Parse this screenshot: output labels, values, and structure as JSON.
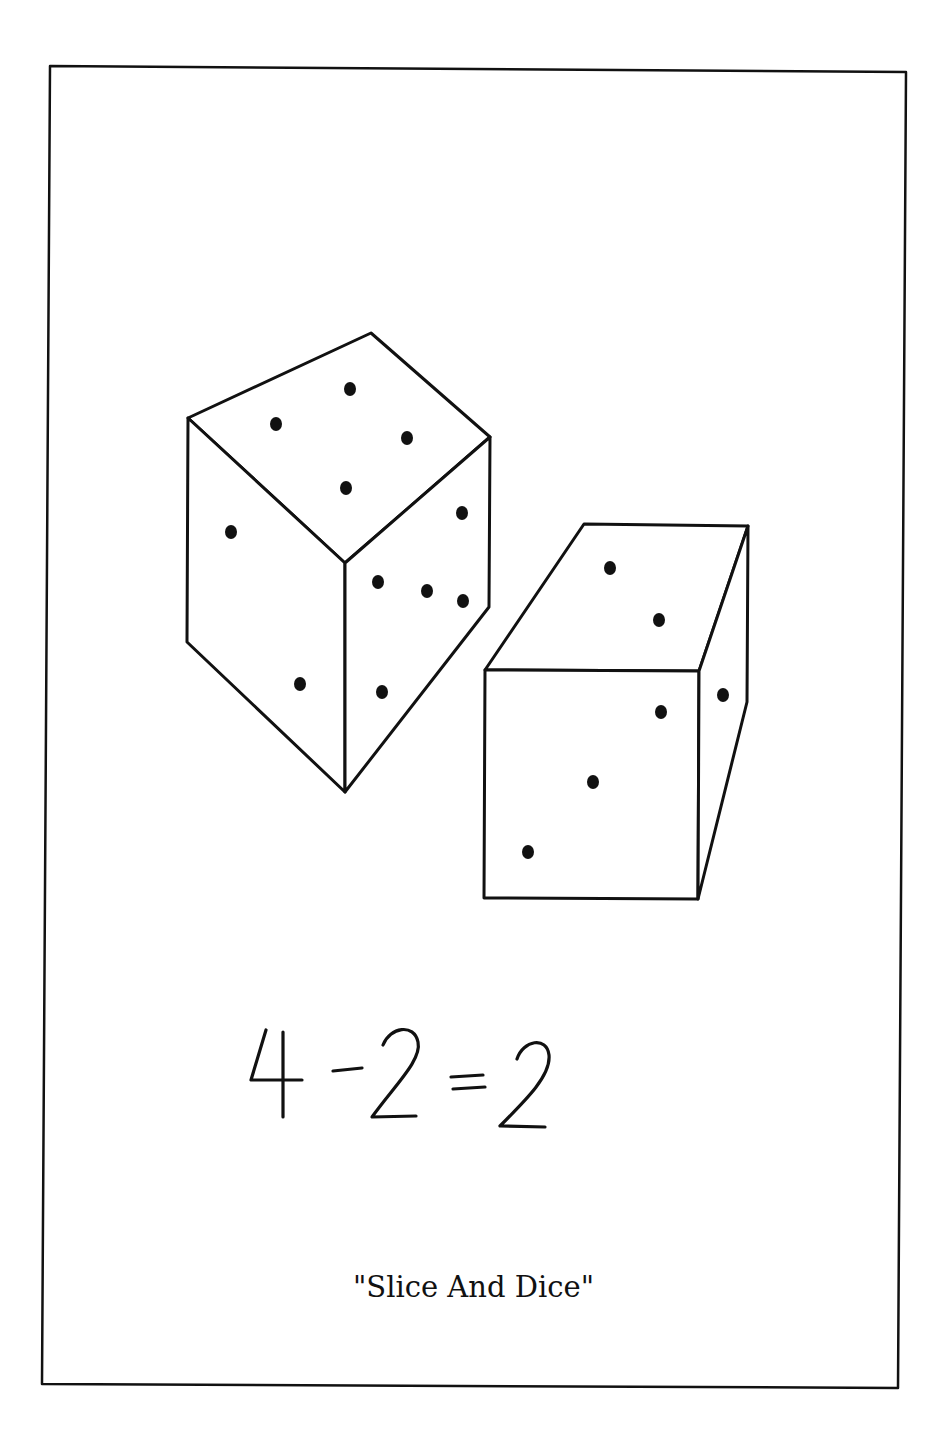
{
  "page": {
    "background": "#ffffff",
    "ink_color": "#111111",
    "frame": {
      "points": [
        [
          50,
          66
        ],
        [
          906,
          72
        ],
        [
          898,
          1388
        ],
        [
          42,
          1384
        ]
      ]
    }
  },
  "illustration": {
    "subject": "two dice, one sliced",
    "die_left": {
      "name": "tall-die",
      "faces": {
        "top": {
          "points": [
            [
              188,
              418
            ],
            [
              371,
              333
            ],
            [
              490,
              437
            ],
            [
              345,
              563
            ]
          ],
          "pips": 4,
          "pip_positions": [
            [
              276,
              424
            ],
            [
              350,
              389
            ],
            [
              407,
              438
            ],
            [
              346,
              488
            ]
          ]
        },
        "left": {
          "points": [
            [
              188,
              418
            ],
            [
              345,
              563
            ],
            [
              345,
              792
            ],
            [
              187,
              642
            ]
          ],
          "pips": 2,
          "pip_positions": [
            [
              231,
              532
            ],
            [
              300,
              684
            ]
          ]
        },
        "right": {
          "points": [
            [
              345,
              563
            ],
            [
              490,
              437
            ],
            [
              489,
              607
            ],
            [
              345,
              792
            ]
          ],
          "pips": 5,
          "pip_positions": [
            [
              462,
              513
            ],
            [
              378,
              582
            ],
            [
              427,
              591
            ],
            [
              463,
              601
            ],
            [
              382,
              692
            ]
          ]
        }
      }
    },
    "die_right": {
      "name": "half-die",
      "faces": {
        "top": {
          "points": [
            [
              485,
              670
            ],
            [
              584,
              524
            ],
            [
              748,
              526
            ],
            [
              699,
              671
            ]
          ],
          "pips": 2,
          "pip_positions": [
            [
              610,
              568
            ],
            [
              659,
              620
            ]
          ]
        },
        "front": {
          "points": [
            [
              485,
              670
            ],
            [
              699,
              671
            ],
            [
              698,
              899
            ],
            [
              484,
              898
            ]
          ],
          "pips": 3,
          "pip_positions": [
            [
              661,
              712
            ],
            [
              593,
              782
            ],
            [
              528,
              852
            ]
          ]
        },
        "side": {
          "points": [
            [
              699,
              671
            ],
            [
              748,
              526
            ],
            [
              747,
              702
            ],
            [
              698,
              899
            ]
          ],
          "pips": 1,
          "pip_positions": [
            [
              723,
              695
            ]
          ]
        }
      }
    }
  },
  "equation": {
    "text": "4 - 2 = 2",
    "parts": [
      "4",
      "-",
      "2",
      "=",
      "2"
    ]
  },
  "caption": {
    "text": "\"Slice And Dice\""
  }
}
